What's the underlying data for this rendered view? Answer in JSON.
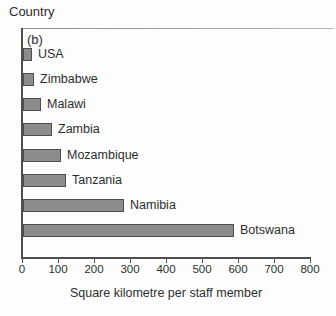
{
  "figure": {
    "y_axis_title": "Country",
    "panel_label": "(b)"
  },
  "chart_data": {
    "type": "bar",
    "orientation": "horizontal",
    "title": "",
    "categories": [
      "USA",
      "Zimbabwe",
      "Malawi",
      "Zambia",
      "Mozambique",
      "Tanzania",
      "Namibia",
      "Botswana"
    ],
    "values": [
      20,
      25,
      45,
      75,
      100,
      115,
      275,
      580
    ],
    "xlabel": "Square kilometre per staff member",
    "ylabel": "Country",
    "xlim": [
      0,
      800
    ],
    "xticks": [
      0,
      100,
      200,
      300,
      400,
      500,
      600,
      700,
      800
    ],
    "grid": false,
    "legend": false,
    "bar_color": "#8c8c8c",
    "bar_border_color": "#4e4e4e"
  },
  "colors": {
    "background": "#fdfdfd",
    "text": "#2e2e2e",
    "axis": "#4f4f4f",
    "top_border": "#a8a8a8"
  }
}
